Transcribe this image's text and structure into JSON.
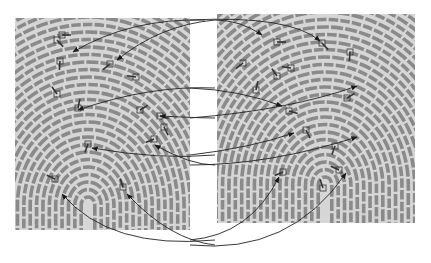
{
  "figure": {
    "background": "#ffffff",
    "ridge_color": "#8a8a8a",
    "paper_color": "#d6d6d6",
    "marker_color": "#333333",
    "arrow_color": "#222222"
  },
  "left_print": {
    "box": [
      15,
      18,
      175,
      212
    ],
    "core": [
      88,
      205
    ],
    "minutiae": [
      [
        62,
        35
      ],
      [
        57,
        40
      ],
      [
        60,
        61
      ],
      [
        110,
        64
      ],
      [
        136,
        77
      ],
      [
        57,
        94
      ],
      [
        78,
        108
      ],
      [
        140,
        110
      ],
      [
        160,
        116
      ],
      [
        164,
        127
      ],
      [
        88,
        144
      ],
      [
        154,
        139
      ],
      [
        55,
        179
      ],
      [
        123,
        187
      ]
    ]
  },
  "right_print": {
    "box": [
      217,
      14,
      198,
      209
    ],
    "core": [
      325,
      185
    ],
    "minutiae": [
      [
        277,
        42
      ],
      [
        322,
        43
      ],
      [
        350,
        52
      ],
      [
        243,
        63
      ],
      [
        291,
        68
      ],
      [
        277,
        76
      ],
      [
        256,
        90
      ],
      [
        347,
        98
      ],
      [
        289,
        111
      ],
      [
        306,
        130
      ],
      [
        335,
        146
      ],
      [
        283,
        172
      ],
      [
        339,
        170
      ],
      [
        323,
        188
      ]
    ]
  },
  "correspondences": [
    {
      "from": [
        205,
        20
      ],
      "to": [
        73,
        52
      ],
      "ctrl": [
        130,
        18
      ]
    },
    {
      "from": [
        215,
        20
      ],
      "to": [
        117,
        60
      ],
      "ctrl": [
        160,
        25
      ]
    },
    {
      "from": [
        215,
        20
      ],
      "to": [
        262,
        35
      ],
      "ctrl": [
        240,
        20
      ]
    },
    {
      "from": [
        190,
        20
      ],
      "to": [
        320,
        41
      ],
      "ctrl": [
        290,
        15
      ]
    },
    {
      "from": [
        215,
        88
      ],
      "to": [
        78,
        110
      ],
      "ctrl": [
        150,
        85
      ]
    },
    {
      "from": [
        215,
        118
      ],
      "to": [
        160,
        116
      ],
      "ctrl": [
        200,
        118
      ]
    },
    {
      "from": [
        190,
        88
      ],
      "to": [
        282,
        106
      ],
      "ctrl": [
        240,
        90
      ]
    },
    {
      "from": [
        190,
        118
      ],
      "to": [
        357,
        86
      ],
      "ctrl": [
        290,
        110
      ]
    },
    {
      "from": [
        215,
        155
      ],
      "to": [
        92,
        148
      ],
      "ctrl": [
        160,
        160
      ]
    },
    {
      "from": [
        215,
        165
      ],
      "to": [
        155,
        145
      ],
      "ctrl": [
        190,
        165
      ]
    },
    {
      "from": [
        190,
        155
      ],
      "to": [
        294,
        133
      ],
      "ctrl": [
        250,
        148
      ]
    },
    {
      "from": [
        190,
        165
      ],
      "to": [
        357,
        137
      ],
      "ctrl": [
        270,
        165
      ]
    },
    {
      "from": [
        215,
        240
      ],
      "to": [
        62,
        194
      ],
      "ctrl": [
        110,
        250
      ]
    },
    {
      "from": [
        215,
        245
      ],
      "to": [
        127,
        194
      ],
      "ctrl": [
        170,
        240
      ]
    },
    {
      "from": [
        190,
        240
      ],
      "to": [
        279,
        177
      ],
      "ctrl": [
        250,
        235
      ]
    },
    {
      "from": [
        190,
        245
      ],
      "to": [
        346,
        173
      ],
      "ctrl": [
        290,
        255
      ]
    }
  ]
}
